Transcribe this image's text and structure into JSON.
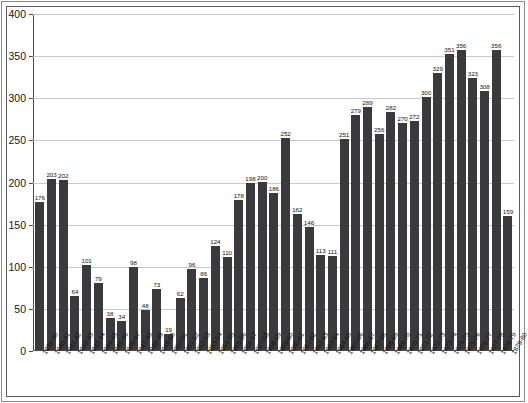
{
  "chart_data": {
    "type": "bar",
    "title": "",
    "xlabel": "",
    "ylabel": "",
    "ylim": [
      0,
      400
    ],
    "ytick_step": 50,
    "yticks": [
      0,
      50,
      100,
      150,
      200,
      250,
      300,
      350,
      400
    ],
    "grid": "horizontal",
    "legend": "none",
    "bar_color": "#3a3a3c",
    "gridline_color": "#c9c9c9",
    "axis_color": "#4a4a4a",
    "categories": [
      "1839-40",
      "1840-41",
      "1841-42",
      "1842-43",
      "1843-44",
      "1844-45",
      "1845-46",
      "1846-47",
      "1847-48",
      "1848-49",
      "1849-50",
      "1850-51",
      "1851-52",
      "1852-53",
      "1853-54",
      "1854-55",
      "1855-56",
      "1856-57",
      "1857-58",
      "1858-59",
      "1859-60",
      "1860-61",
      "1861-62",
      "1862-63",
      "1863-64",
      "1864-65",
      "1865-66",
      "1866-67",
      "1867-68",
      "1868-69",
      "1869-70",
      "1870-71",
      "1871-72",
      "1872-73",
      "1873-74",
      "1874-75",
      "1875-76",
      "1876-77",
      "1877-78",
      "1878-79",
      "1879-80"
    ],
    "values": [
      176,
      203,
      202,
      64,
      101,
      79,
      38,
      34,
      98,
      48,
      73,
      19,
      62,
      96,
      86,
      124,
      110,
      178,
      198,
      200,
      186,
      252,
      162,
      146,
      113,
      111,
      251,
      279,
      289,
      256,
      282,
      270,
      272,
      300,
      329,
      351,
      356,
      323,
      308,
      356,
      159
    ]
  }
}
